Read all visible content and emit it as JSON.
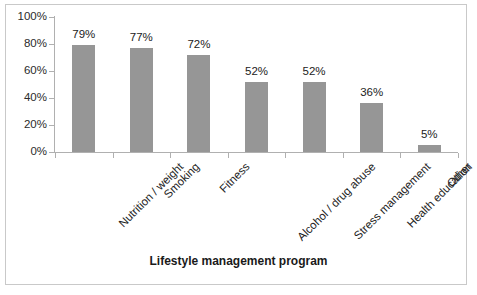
{
  "chart_data": {
    "type": "bar",
    "title": "",
    "xlabel": "Lifestyle management program",
    "ylabel": "",
    "categories": [
      "Nutrition / weight",
      "Smoking",
      "Fitness",
      "Alcohol / drug abuse",
      "Stress management",
      "Health education",
      "Other"
    ],
    "values": [
      79,
      77,
      72,
      52,
      52,
      36,
      5
    ],
    "value_labels": [
      "79%",
      "77%",
      "72%",
      "52%",
      "52%",
      "36%",
      "5%"
    ],
    "ylim": [
      0,
      100
    ],
    "ytick_values": [
      0,
      20,
      40,
      60,
      80,
      100
    ],
    "ytick_labels": [
      "0%",
      "20%",
      "40%",
      "60%",
      "80%",
      "100%"
    ],
    "grid": false,
    "legend": "none",
    "bar_color": "#969696",
    "axis_color": "#b0b0b0",
    "text_color": "#222222",
    "border_color": "#c9c9c9",
    "background": "#ffffff"
  }
}
